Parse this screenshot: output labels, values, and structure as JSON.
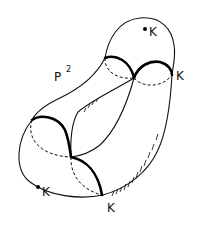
{
  "figure": {
    "labels": {
      "surface": "P",
      "surface_superscript": "2",
      "k_top_point": "K",
      "k_right": "K",
      "k_bottom_point": "K",
      "k_bottom": "K"
    },
    "colors": {
      "background": "#ffffff",
      "ink": "#111111"
    }
  }
}
